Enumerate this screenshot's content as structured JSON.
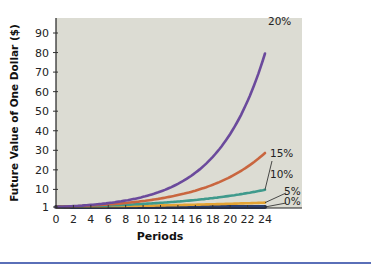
{
  "chart_data": {
    "type": "line",
    "title": "",
    "xlabel": "Periods",
    "ylabel": "Future Value of One Dollar ($)",
    "xlim": [
      0,
      24
    ],
    "ylim": [
      0,
      97
    ],
    "x_ticks": [
      0,
      2,
      4,
      6,
      8,
      10,
      12,
      14,
      16,
      18,
      20,
      22,
      24
    ],
    "y_ticks": [
      1,
      10,
      20,
      30,
      40,
      50,
      60,
      70,
      80,
      90
    ],
    "grid": false,
    "legend": "inline labels at line ends",
    "x": [
      0,
      2,
      4,
      6,
      8,
      10,
      12,
      14,
      16,
      18,
      20,
      22,
      24
    ],
    "series": [
      {
        "name": "20%",
        "rate": 0.2,
        "color": "#6b4a9c",
        "values": [
          1,
          1.44,
          2.07,
          2.99,
          4.3,
          6.19,
          8.92,
          12.84,
          18.49,
          26.62,
          38.34,
          55.21,
          79.5
        ]
      },
      {
        "name": "15%",
        "rate": 0.15,
        "color": "#c9663f",
        "values": [
          1,
          1.32,
          1.75,
          2.31,
          3.06,
          4.05,
          5.35,
          7.08,
          9.36,
          12.38,
          16.37,
          21.64,
          28.63
        ]
      },
      {
        "name": "10%",
        "rate": 0.1,
        "color": "#3f9a8c",
        "values": [
          1,
          1.21,
          1.46,
          1.77,
          2.14,
          2.59,
          3.14,
          3.8,
          4.59,
          5.56,
          6.73,
          8.14,
          9.85
        ]
      },
      {
        "name": "5%",
        "rate": 0.05,
        "color": "#e3a334",
        "values": [
          1,
          1.1,
          1.22,
          1.34,
          1.48,
          1.63,
          1.8,
          1.98,
          2.18,
          2.41,
          2.65,
          2.93,
          3.23
        ]
      },
      {
        "name": "0%",
        "rate": 0.0,
        "color": "#2b3e70",
        "values": [
          1,
          1,
          1,
          1,
          1,
          1,
          1,
          1,
          1,
          1,
          1,
          1,
          1
        ]
      }
    ]
  },
  "colors": {
    "plot_bg": "#dcdcd3",
    "axis": "#222222",
    "rule": "#5a6fb8"
  }
}
